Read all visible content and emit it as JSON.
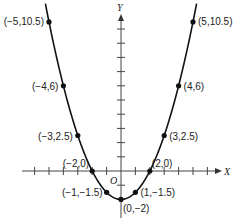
{
  "chart_data": {
    "type": "line",
    "title": "",
    "xlabel": "X",
    "ylabel": "Y",
    "origin_label": "O",
    "function": "y = 0.5x^2 - 2",
    "x": [
      -5,
      -4,
      -3,
      -2,
      -1,
      0,
      1,
      2,
      3,
      4,
      5
    ],
    "y": [
      10.5,
      6,
      2.5,
      0,
      -1.5,
      -2,
      -1.5,
      0,
      2.5,
      6,
      10.5
    ],
    "points": [
      {
        "label": "(−5,10.5)",
        "x": -5,
        "y": 10.5
      },
      {
        "label": "(−4,6)",
        "x": -4,
        "y": 6
      },
      {
        "label": "(−3,2.5)",
        "x": -3,
        "y": 2.5
      },
      {
        "label": "(−2,0)",
        "x": -2,
        "y": 0
      },
      {
        "label": "(−1,−1.5)",
        "x": -1,
        "y": -1.5
      },
      {
        "label": "(0,−2)",
        "x": 0,
        "y": -2
      },
      {
        "label": "(1,−1.5)",
        "x": 1,
        "y": -1.5
      },
      {
        "label": "(2,0)",
        "x": 2,
        "y": 0
      },
      {
        "label": "(3,2.5)",
        "x": 3,
        "y": 2.5
      },
      {
        "label": "(4,6)",
        "x": 4,
        "y": 6
      },
      {
        "label": "(5,10.5)",
        "x": 5,
        "y": 10.5
      }
    ],
    "xlim": [
      -7,
      7
    ],
    "ylim": [
      -2.5,
      11.5
    ],
    "grid": false,
    "legend": null
  }
}
